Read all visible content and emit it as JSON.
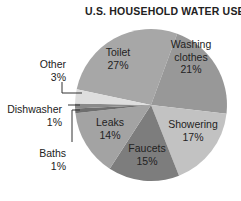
{
  "chart_data": {
    "type": "pie",
    "title": "U.S. HOUSEHOLD WATER USE",
    "start_angle_deg": 282,
    "direction": "clockwise",
    "center": [
      151,
      105
    ],
    "radius": 76,
    "slices": [
      {
        "label": "Toilet",
        "value": 27,
        "pct": "27%",
        "color": "#a7a7a7",
        "label_lines": [
          "Toilet",
          "27%"
        ],
        "label_pos": [
          118,
          56
        ],
        "inside": true
      },
      {
        "label": "Washing clothes",
        "value": 21,
        "pct": "21%",
        "color": "#989898",
        "label_lines": [
          "Washing",
          "clothes",
          "21%"
        ],
        "label_pos": [
          191,
          48
        ],
        "inside": true
      },
      {
        "label": "Showering",
        "value": 17,
        "pct": "17%",
        "color": "#c2c2c2",
        "label_lines": [
          "Showering",
          "17%"
        ],
        "label_pos": [
          193,
          128
        ],
        "inside": true
      },
      {
        "label": "Faucets",
        "value": 15,
        "pct": "15%",
        "color": "#7d7d7d",
        "label_lines": [
          "Faucets",
          "15%"
        ],
        "label_pos": [
          147,
          152
        ],
        "inside": true
      },
      {
        "label": "Leaks",
        "value": 14,
        "pct": "14%",
        "color": "#a3a3a3",
        "label_lines": [
          "Leaks",
          "14%"
        ],
        "label_pos": [
          110,
          126
        ],
        "inside": true
      },
      {
        "label": "Baths",
        "value": 1,
        "pct": "1%",
        "color": "#6e6e6e",
        "label_lines": [
          "Baths",
          "1%"
        ],
        "label_pos": [
          66,
          157
        ],
        "inside": false
      },
      {
        "label": "Dishwasher",
        "value": 1,
        "pct": "1%",
        "color": "#8a8a8a",
        "label_lines": [
          "Dishwasher",
          "1%"
        ],
        "label_pos": [
          62,
          113
        ],
        "inside": false
      },
      {
        "label": "Other",
        "value": 3,
        "pct": "3%",
        "color": "#dedede",
        "label_lines": [
          "Other",
          "3%"
        ],
        "label_pos": [
          66,
          68
        ],
        "inside": false
      }
    ],
    "leaders": [
      {
        "for": "Other",
        "points": [
          [
            62,
            82
          ],
          [
            62,
            93
          ],
          [
            82,
            93
          ]
        ]
      },
      {
        "for": "Dishwasher",
        "points": [
          [
            68,
            105
          ],
          [
            80,
            105
          ]
        ]
      },
      {
        "for": "Baths",
        "points": [
          [
            72,
            142
          ],
          [
            72,
            110
          ],
          [
            80,
            110
          ]
        ]
      }
    ]
  }
}
